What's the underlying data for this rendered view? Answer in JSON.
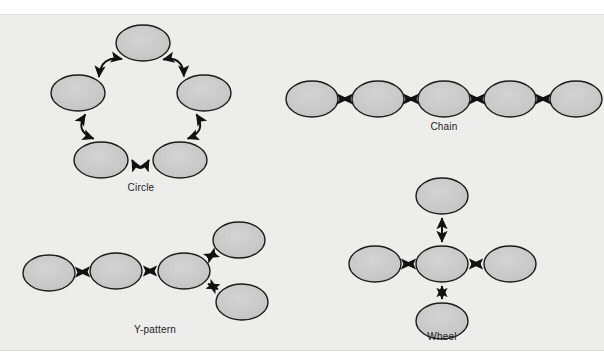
{
  "figure": {
    "background_color": "#eeeeec",
    "page_color": "#ffffff",
    "caption_remnant": "",
    "node_fill": "#c9c9c9",
    "node_stroke": "#1b1b1b",
    "arrow_color": "#111111",
    "label_color": "#1b1b1b"
  },
  "chart_data": {
    "type": "diagram",
    "diagram_kind": "node-link network patterns",
    "node_shape": "ellipse",
    "edge_style": "double-headed arrow",
    "patterns": [
      {
        "name": "Circle",
        "label": "Circle",
        "node_count": 5,
        "edge_count": 5,
        "edge_shape": "curved",
        "layout": "pentagon ring",
        "nodes": [
          {
            "id": "c1",
            "cx": 143,
            "cy": 42,
            "rx": 27,
            "ry": 18
          },
          {
            "id": "c2",
            "cx": 78,
            "cy": 92,
            "rx": 27,
            "ry": 18
          },
          {
            "id": "c3",
            "cx": 204,
            "cy": 92,
            "rx": 27,
            "ry": 18
          },
          {
            "id": "c4",
            "cx": 101,
            "cy": 159,
            "rx": 27,
            "ry": 18
          },
          {
            "id": "c5",
            "cx": 180,
            "cy": 159,
            "rx": 27,
            "ry": 18
          }
        ],
        "edges": [
          {
            "from": "c2",
            "to": "c1"
          },
          {
            "from": "c1",
            "to": "c3"
          },
          {
            "from": "c3",
            "to": "c5"
          },
          {
            "from": "c5",
            "to": "c4"
          },
          {
            "from": "c4",
            "to": "c2"
          }
        ],
        "label_pos": {
          "x": 141,
          "y": 187
        }
      },
      {
        "name": "Chain",
        "label": "Chain",
        "node_count": 5,
        "edge_count": 4,
        "edge_shape": "straight",
        "layout": "horizontal line",
        "nodes": [
          {
            "id": "h1",
            "cx": 312,
            "cy": 98,
            "rx": 26,
            "ry": 18
          },
          {
            "id": "h2",
            "cx": 378,
            "cy": 98,
            "rx": 26,
            "ry": 18
          },
          {
            "id": "h3",
            "cx": 444,
            "cy": 98,
            "rx": 26,
            "ry": 18
          },
          {
            "id": "h4",
            "cx": 510,
            "cy": 98,
            "rx": 26,
            "ry": 18
          },
          {
            "id": "h5",
            "cx": 576,
            "cy": 98,
            "rx": 26,
            "ry": 18
          }
        ],
        "edges": [
          {
            "from": "h1",
            "to": "h2"
          },
          {
            "from": "h2",
            "to": "h3"
          },
          {
            "from": "h3",
            "to": "h4"
          },
          {
            "from": "h4",
            "to": "h5"
          }
        ],
        "label_pos": {
          "x": 444,
          "y": 126
        }
      },
      {
        "name": "Y-pattern",
        "label": "Y-pattern",
        "node_count": 5,
        "edge_count": 4,
        "edge_shape": "straight",
        "layout": "chain of three with two-way fork",
        "nodes": [
          {
            "id": "y1",
            "cx": 49,
            "cy": 272,
            "rx": 26,
            "ry": 18
          },
          {
            "id": "y2",
            "cx": 116,
            "cy": 270,
            "rx": 26,
            "ry": 18
          },
          {
            "id": "y3",
            "cx": 184,
            "cy": 270,
            "rx": 26,
            "ry": 18
          },
          {
            "id": "y4",
            "cx": 239,
            "cy": 239,
            "rx": 26,
            "ry": 18
          },
          {
            "id": "y5",
            "cx": 242,
            "cy": 301,
            "rx": 26,
            "ry": 18
          }
        ],
        "edges": [
          {
            "from": "y1",
            "to": "y2"
          },
          {
            "from": "y2",
            "to": "y3"
          },
          {
            "from": "y3",
            "to": "y4"
          },
          {
            "from": "y3",
            "to": "y5"
          }
        ],
        "label_pos": {
          "x": 155,
          "y": 329
        }
      },
      {
        "name": "Wheel",
        "label": "Wheel",
        "node_count": 5,
        "edge_count": 4,
        "edge_shape": "straight",
        "layout": "central hub with four spokes",
        "nodes": [
          {
            "id": "w_hub",
            "cx": 442,
            "cy": 263,
            "rx": 26,
            "ry": 18
          },
          {
            "id": "w_top",
            "cx": 442,
            "cy": 195,
            "rx": 26,
            "ry": 18
          },
          {
            "id": "w_left",
            "cx": 375,
            "cy": 263,
            "rx": 26,
            "ry": 18
          },
          {
            "id": "w_right",
            "cx": 510,
            "cy": 263,
            "rx": 26,
            "ry": 18
          },
          {
            "id": "w_bot",
            "cx": 442,
            "cy": 320,
            "rx": 26,
            "ry": 18
          }
        ],
        "edges": [
          {
            "from": "w_hub",
            "to": "w_top"
          },
          {
            "from": "w_hub",
            "to": "w_left"
          },
          {
            "from": "w_hub",
            "to": "w_right"
          },
          {
            "from": "w_hub",
            "to": "w_bot"
          }
        ],
        "label_pos": {
          "x": 442,
          "y": 336
        }
      }
    ]
  }
}
